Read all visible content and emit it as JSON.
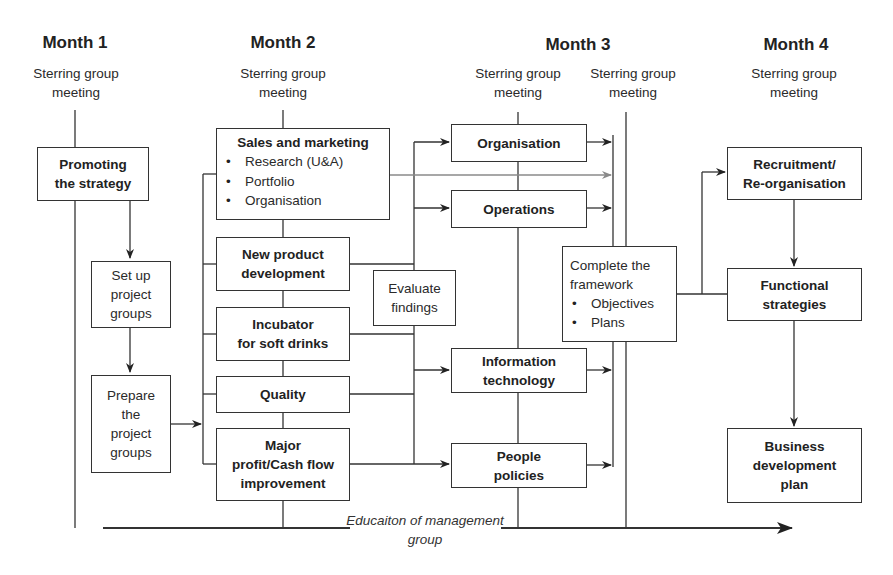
{
  "months": [
    {
      "label": "Month 1",
      "meeting": [
        "Sterring group",
        "meeting"
      ]
    },
    {
      "label": "Month 2",
      "meeting": [
        "Sterring group",
        "meeting"
      ]
    },
    {
      "label": "Month 3",
      "meeting": [
        "Sterring group",
        "meeting"
      ]
    },
    {
      "label": "Month 4",
      "meeting": [
        "Sterring group",
        "meeting"
      ]
    }
  ],
  "month3_second_meeting": [
    "Sterring group",
    "meeting"
  ],
  "month1": {
    "promoting": [
      "Promoting",
      "the strategy"
    ],
    "setup": [
      "Set up",
      "project",
      "groups"
    ],
    "prepare": [
      "Prepare",
      "the",
      "project",
      "groups"
    ]
  },
  "month2": {
    "sales": {
      "title": "Sales and marketing",
      "bullets": [
        "Research (U&A)",
        "Portfolio",
        "Organisation"
      ]
    },
    "npd": [
      "New product",
      "development"
    ],
    "incubator": [
      "Incubator",
      "for soft drinks"
    ],
    "quality": [
      "Quality"
    ],
    "major": [
      "Major",
      "profit/Cash flow",
      "improvement"
    ],
    "evaluate": [
      "Evaluate",
      "findings"
    ]
  },
  "month3": {
    "organisation": [
      "Organisation"
    ],
    "operations": [
      "Operations"
    ],
    "it": [
      "Information",
      "technology"
    ],
    "people": [
      "People",
      "policies"
    ],
    "complete": {
      "title": [
        "Complete the",
        "framework"
      ],
      "bullets": [
        "Objectives",
        "Plans"
      ]
    }
  },
  "month4": {
    "recruitment": [
      "Recruitment/",
      "Re-organisation"
    ],
    "functional": [
      "Functional",
      "strategies"
    ],
    "business": [
      "Business",
      "development",
      "plan"
    ]
  },
  "education": [
    "Educaiton of",
    "management group"
  ],
  "colors": {
    "line": "#333333",
    "grey_arrow": "#8a8a8a",
    "text": "#222222"
  }
}
